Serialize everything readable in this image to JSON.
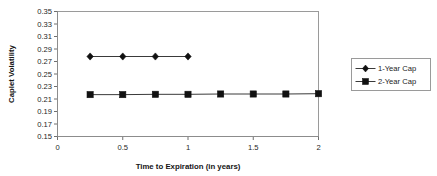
{
  "chart_data": {
    "type": "line",
    "title": "",
    "xlabel": "Time to Expiration (in years)",
    "ylabel": "Caplet Volatility",
    "xlim": [
      0,
      2
    ],
    "ylim": [
      0.15,
      0.35
    ],
    "grid": false,
    "legend_position": "right",
    "x_ticks": [
      "0",
      "0.5",
      "1",
      "1.5",
      "2"
    ],
    "x_tick_values": [
      0,
      0.5,
      1,
      1.5,
      2
    ],
    "y_ticks": [
      "0.15",
      "0.17",
      "0.19",
      "0.21",
      "0.23",
      "0.25",
      "0.27",
      "0.29",
      "0.31",
      "0.33",
      "0.35"
    ],
    "y_tick_values": [
      0.15,
      0.17,
      0.19,
      0.21,
      0.23,
      0.25,
      0.27,
      0.29,
      0.31,
      0.33,
      0.35
    ],
    "series": [
      {
        "name": "1-Year Cap",
        "marker": "diamond",
        "color": "#111111",
        "x": [
          0.25,
          0.5,
          0.75,
          1.0
        ],
        "values": [
          0.278,
          0.278,
          0.278,
          0.278
        ]
      },
      {
        "name": "2-Year Cap",
        "marker": "square",
        "color": "#111111",
        "x": [
          0.25,
          0.5,
          0.75,
          1.0,
          1.25,
          1.5,
          1.75,
          2.0
        ],
        "values": [
          0.217,
          0.217,
          0.2175,
          0.2175,
          0.218,
          0.218,
          0.218,
          0.2185
        ]
      }
    ]
  },
  "legend": {
    "entries": [
      {
        "label": "1-Year Cap",
        "marker": "diamond"
      },
      {
        "label": "2-Year Cap",
        "marker": "square"
      }
    ]
  },
  "axes": {
    "y_title": "Caplet Volatility",
    "x_title": "Time to Expiration (in years)"
  }
}
